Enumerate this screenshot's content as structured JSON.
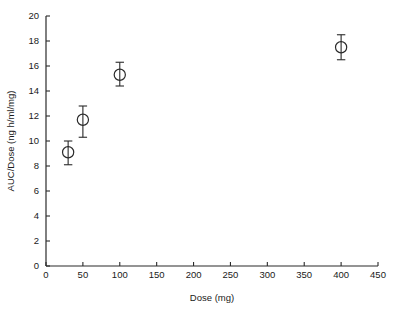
{
  "chart_data": {
    "type": "scatter",
    "title": "",
    "subtitle": "",
    "xlabel": "Dose (mg)",
    "ylabel": "AUC/Dose (ng h/ml/mg)",
    "xlim": [
      0,
      450
    ],
    "ylim": [
      0,
      20
    ],
    "xticks": [
      0,
      50,
      100,
      150,
      200,
      250,
      300,
      350,
      400,
      450
    ],
    "xtick_labels": [
      "0",
      "50",
      "100",
      "150",
      "200",
      "250",
      "300",
      "350",
      "400",
      "450"
    ],
    "yticks": [
      0,
      2,
      4,
      6,
      8,
      10,
      12,
      14,
      16,
      18,
      20
    ],
    "ytick_labels": [
      "0",
      "2",
      "4",
      "6",
      "8",
      "10",
      "12",
      "14",
      "16",
      "18",
      "20"
    ],
    "grid": false,
    "legend": null,
    "marker_style": "open-circle",
    "series": [
      {
        "name": "AUC/Dose",
        "x": [
          30,
          50,
          100,
          400
        ],
        "y": [
          9.1,
          11.7,
          15.3,
          17.5
        ],
        "yerr_low": [
          1.0,
          1.4,
          0.9,
          1.0
        ],
        "yerr_high": [
          0.9,
          1.1,
          1.0,
          1.0
        ]
      }
    ],
    "annotations": []
  },
  "figure": {
    "background_color": "#ffffff",
    "axis_color": "#2a2a2a",
    "marker_color": "#2a2a2a"
  }
}
